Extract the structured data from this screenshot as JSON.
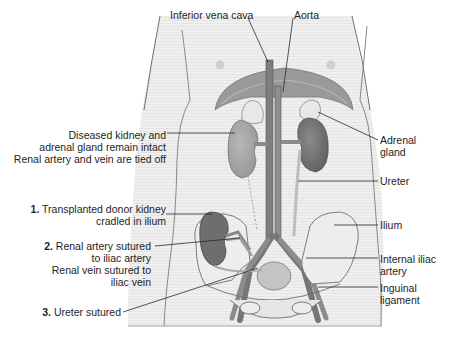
{
  "figure": {
    "colors": {
      "background": "#ffffff",
      "skin": "#ececec",
      "outline": "#6e6e6e",
      "organ_dark": "#6a6a6a",
      "organ_mid": "#8c8c8c",
      "organ_light": "#b4b4b4",
      "bone": "#e6e6e6",
      "leader": "#2a2a2a"
    }
  },
  "labels": {
    "top": {
      "ivc": "Inferior vena cava",
      "aorta": "Aorta"
    },
    "left": {
      "diseased": {
        "line1": "Diseased kidney and",
        "line2": "adrenal gland remain intact",
        "line3": "Renal artery and vein are tied off"
      },
      "step1": {
        "num": "1.",
        "line1": "Transplanted donor kidney",
        "line2": "cradled in ilium"
      },
      "step2": {
        "num": "2.",
        "line1": "Renal artery sutured",
        "line2": "to iliac artery",
        "line3": "Renal vein sutured to",
        "line4": "iliac vein"
      },
      "step3": {
        "num": "3.",
        "line1": "Ureter sutured"
      }
    },
    "right": {
      "adrenal": {
        "line1": "Adrenal",
        "line2": "gland"
      },
      "ureter": "Ureter",
      "ilium": "Ilium",
      "internal_iliac": {
        "line1": "Internal iliac",
        "line2": "artery"
      },
      "inguinal": {
        "line1": "Inguinal",
        "line2": "ligament"
      }
    }
  }
}
